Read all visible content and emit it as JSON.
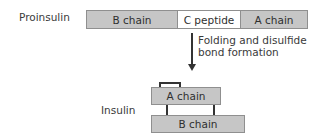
{
  "proinsulin": {
    "label": "Proinsulin",
    "segments": [
      {
        "name": "B chain",
        "fill": "#c6c6c6"
      },
      {
        "name": "C peptide",
        "fill": "#ffffff"
      },
      {
        "name": "A chain",
        "fill": "#c6c6c6"
      }
    ]
  },
  "step": {
    "line1": "Folding and disulfide",
    "line2": "bond formation"
  },
  "insulin": {
    "label": "Insulin",
    "a_chain": "A chain",
    "b_chain": "B chain"
  }
}
